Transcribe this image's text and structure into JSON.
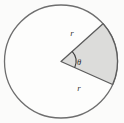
{
  "figure": {
    "kind": "circle-with-shaded-sector",
    "background_color": "#fbfbfa",
    "circle": {
      "center_x": 61,
      "center_y": 61.5,
      "radius": 56.5,
      "stroke_color": "#6e6e6e",
      "stroke_width": 1.3,
      "fill_color": "#fdfdfc"
    },
    "sector": {
      "fill_color": "#dcdcda",
      "stroke_color": "#5c5c5c",
      "stroke_width": 1.3,
      "start_angle_deg": -42,
      "end_angle_deg": 24,
      "vertex_x": 61,
      "vertex_y": 61.5
    },
    "angle_arc": {
      "radius": 15,
      "stroke_color": "#3d3d3d",
      "stroke_width": 1.1
    }
  },
  "labels": {
    "radius_upper": "r",
    "radius_lower": "r",
    "angle": "θ"
  },
  "label_positions": {
    "radius_upper": {
      "x": 72,
      "y": 36
    },
    "radius_lower": {
      "x": 79,
      "y": 91
    },
    "angle": {
      "x": 79,
      "y": 65
    }
  }
}
